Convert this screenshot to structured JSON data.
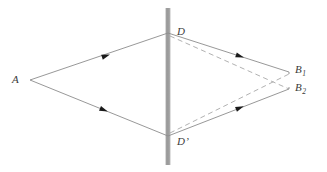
{
  "figure": {
    "background_color": "#ffffff"
  },
  "labels": {
    "source": {
      "text": "A",
      "name": "point-a"
    },
    "aperture_top": {
      "text": "D",
      "name": "point-d"
    },
    "aperture_bottom": {
      "text": "D",
      "prime": "’",
      "name": "point-d-prime"
    },
    "screen_point_1": {
      "base": "B",
      "sub": "1",
      "name": "point-b1"
    },
    "screen_point_2": {
      "base": "B",
      "sub": "2",
      "name": "point-b2"
    }
  },
  "geometry": {
    "point_A": {
      "x": 30,
      "y": 80
    },
    "point_D": {
      "x": 168,
      "y": 33
    },
    "point_Dprime": {
      "x": 168,
      "y": 136
    },
    "point_B1": {
      "x": 289,
      "y": 72
    },
    "point_B2": {
      "x": 289,
      "y": 89
    },
    "barrier": {
      "x": 168,
      "y_top": 8,
      "y_bottom": 165,
      "width": 5
    }
  },
  "rays": {
    "solid": [
      {
        "name": "ray-a-to-d",
        "from": "A",
        "to": "D",
        "arrow_at": 0.52
      },
      {
        "name": "ray-a-to-dprime",
        "from": "A",
        "to": "D'",
        "arrow_at": 0.52
      },
      {
        "name": "ray-d-to-b1",
        "from": "D",
        "to": "B1",
        "arrow_at": 0.6
      },
      {
        "name": "ray-dprime-to-b2",
        "from": "D'",
        "to": "B2",
        "arrow_at": 0.6
      }
    ],
    "dashed": [
      {
        "name": "ray-d-to-b2-dashed",
        "from": "D",
        "to": "B2"
      },
      {
        "name": "ray-dprime-to-b1-dashed",
        "from": "D'",
        "to": "B1"
      }
    ]
  },
  "colors": {
    "ray_solid": "#8c8c8c",
    "ray_dashed": "#a8a8a8",
    "arrowhead": "#1a1a1a",
    "barrier_light": "#bdbdbd",
    "barrier_mid": "#9a9a9a",
    "barrier_dark": "#8a8a8a",
    "label_text": "#3a3a3a"
  }
}
